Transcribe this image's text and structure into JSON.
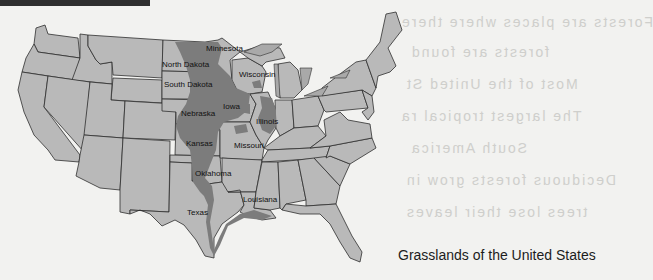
{
  "page": {
    "heading_fragment": "",
    "caption": "Grasslands of the United States"
  },
  "map": {
    "title": "Grasslands of the United States",
    "colors": {
      "background": "#f2f2f0",
      "state_fill": "#b9b9b9",
      "grassland_fill": "#7c7c7c",
      "border": "#2e2e2e"
    },
    "labels": [
      {
        "name": "Minnesota",
        "x": 206,
        "y": 49
      },
      {
        "name": "North Dakota",
        "x": 162,
        "y": 64
      },
      {
        "name": "Wisconsin",
        "x": 239,
        "y": 74
      },
      {
        "name": "South Dakota",
        "x": 164,
        "y": 84
      },
      {
        "name": "Iowa",
        "x": 223,
        "y": 106
      },
      {
        "name": "Nebraska",
        "x": 181,
        "y": 113
      },
      {
        "name": "Illinois",
        "x": 256,
        "y": 121
      },
      {
        "name": "Kansas",
        "x": 186,
        "y": 143
      },
      {
        "name": "Missouri",
        "x": 234,
        "y": 145
      },
      {
        "name": "Oklahoma",
        "x": 195,
        "y": 173
      },
      {
        "name": "Louisiana",
        "x": 243,
        "y": 199
      },
      {
        "name": "Texas",
        "x": 187,
        "y": 212
      }
    ]
  },
  "bleed_through": [
    {
      "text": "Forests are places where there",
      "x": 400,
      "y": 12
    },
    {
      "text": "forests are found",
      "x": 410,
      "y": 44
    },
    {
      "text": "Most of the United St",
      "x": 405,
      "y": 76
    },
    {
      "text": "The largest tropical ra",
      "x": 400,
      "y": 110
    },
    {
      "text": "South America",
      "x": 410,
      "y": 142
    },
    {
      "text": "Deciduous forests grow in",
      "x": 405,
      "y": 175
    },
    {
      "text": "trees lose their leaves",
      "x": 405,
      "y": 205
    }
  ]
}
